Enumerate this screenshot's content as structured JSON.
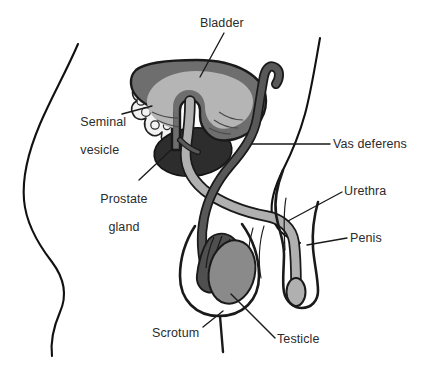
{
  "figure": {
    "background_color": "#ffffff",
    "width": 422,
    "height": 375
  },
  "palette": {
    "outline": "#1a1a1a",
    "body_contour": "#111111",
    "bladder_wall": "#6e6e6e",
    "bladder_lumen": "#b5b5b5",
    "prostate": "#2d2d2d",
    "seminal_vesicle_fill": "#f2f2f2",
    "vas_deferens": "#585858",
    "urethra": "#b0b0b0",
    "testicle": "#8a8a8a",
    "epididymis": "#4f4f4f",
    "glans": "#b0b0b0",
    "label_text": "#2b2b2b",
    "leader_line": "#1a1a1a"
  },
  "labels": [
    {
      "id": "bladder",
      "text": "Bladder",
      "lines": [
        "Bladder"
      ],
      "x": 200,
      "y": 17,
      "align": "left"
    },
    {
      "id": "seminal-vesicle",
      "text": "Seminal vesicle",
      "lines": [
        "Seminal",
        "vesicle"
      ],
      "x": 66,
      "y": 101,
      "align": "left"
    },
    {
      "id": "prostate-gland",
      "text": "Prostate gland",
      "lines": [
        "Prostate",
        "gland"
      ],
      "x": 86,
      "y": 178,
      "align": "left"
    },
    {
      "id": "vas-deferens",
      "text": "Vas deferens",
      "lines": [
        "Vas deferens"
      ],
      "x": 333,
      "y": 138,
      "align": "left"
    },
    {
      "id": "urethra",
      "text": "Urethra",
      "lines": [
        "Urethra"
      ],
      "x": 344,
      "y": 185,
      "align": "left"
    },
    {
      "id": "penis",
      "text": "Penis",
      "lines": [
        "Penis"
      ],
      "x": 350,
      "y": 232,
      "align": "left"
    },
    {
      "id": "scrotum",
      "text": "Scrotum",
      "lines": [
        "Scrotum"
      ],
      "x": 152,
      "y": 327,
      "align": "left"
    },
    {
      "id": "testicle",
      "text": "Testicle",
      "lines": [
        "Testicle"
      ],
      "x": 277,
      "y": 333,
      "align": "left"
    }
  ],
  "leader_lines": [
    {
      "id": "bladder-leader",
      "from": [
        224,
        33
      ],
      "to": [
        200,
        77
      ]
    },
    {
      "id": "seminal-vesicle-leader",
      "from": [
        122,
        114
      ],
      "to": [
        152,
        106
      ]
    },
    {
      "id": "prostate-leader",
      "from": [
        139,
        180
      ],
      "to": [
        172,
        149
      ]
    },
    {
      "id": "vas-deferens-leader",
      "from": [
        330,
        144
      ],
      "to": [
        252,
        144
      ]
    },
    {
      "id": "urethra-leader",
      "from": [
        342,
        192
      ],
      "to": [
        288,
        221
      ]
    },
    {
      "id": "penis-leader",
      "from": [
        347,
        238
      ],
      "to": [
        307,
        245
      ]
    },
    {
      "id": "scrotum-leader",
      "from": [
        203,
        327
      ],
      "to": [
        223,
        311
      ]
    },
    {
      "id": "testicle-leader",
      "from": [
        275,
        338
      ],
      "to": [
        231,
        294
      ]
    }
  ],
  "structures": [
    {
      "id": "body-contour-left",
      "name": "Abdominal / flank body outline (left)"
    },
    {
      "id": "body-contour-right",
      "name": "Pelvic / groin body outline (right)"
    },
    {
      "id": "bladder",
      "name": "Urinary bladder"
    },
    {
      "id": "seminal-vesicle",
      "name": "Seminal vesicle"
    },
    {
      "id": "prostate-gland",
      "name": "Prostate gland"
    },
    {
      "id": "vas-deferens",
      "name": "Vas deferens"
    },
    {
      "id": "urethra",
      "name": "Urethra"
    },
    {
      "id": "penis",
      "name": "Penis"
    },
    {
      "id": "glans",
      "name": "Glans penis"
    },
    {
      "id": "scrotum",
      "name": "Scrotum"
    },
    {
      "id": "testicle",
      "name": "Testicle"
    },
    {
      "id": "epididymis",
      "name": "Epididymis"
    }
  ]
}
